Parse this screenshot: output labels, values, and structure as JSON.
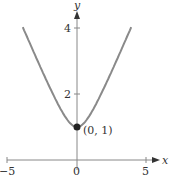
{
  "chart_data": {
    "type": "line",
    "title": "",
    "xlabel": "x",
    "ylabel": "y",
    "xlim": [
      -5,
      5
    ],
    "ylim": [
      0,
      4.3
    ],
    "xticks": [
      -5,
      0,
      5
    ],
    "xtick_labels": [
      "−5",
      "0",
      "5"
    ],
    "yticks": [
      2,
      4
    ],
    "ytick_labels": [
      "2",
      "4"
    ],
    "grid": false,
    "series": [
      {
        "name": "y = sqrt(1 + x^2)",
        "color": "#8a8a8a",
        "x": [
          -3.9,
          -3,
          -2,
          -1,
          0,
          1,
          2,
          3,
          3.9
        ],
        "y": [
          4.03,
          3.16,
          2.24,
          1.41,
          1.0,
          1.41,
          2.24,
          3.16,
          4.03
        ]
      }
    ],
    "annotations": [
      {
        "label": "(0, 1)",
        "x": 0,
        "y": 1,
        "marker": "filled-circle"
      }
    ]
  }
}
